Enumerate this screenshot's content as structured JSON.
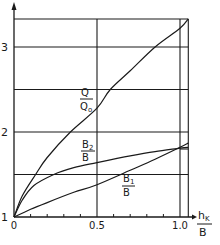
{
  "chart_data": {
    "type": "line",
    "title": "",
    "xlabel": {
      "numerator": "h_K",
      "numerator_main": "h",
      "numerator_sub": "K",
      "denominator": "B"
    },
    "ylabel": "",
    "xlim": [
      0,
      1.05
    ],
    "ylim": [
      1,
      3.33
    ],
    "x_ticks": [
      {
        "value": 0,
        "label": "0"
      },
      {
        "value": 0.5,
        "label": "0.5"
      },
      {
        "value": 1.0,
        "label": "1.0"
      }
    ],
    "x_minor_ticks": [
      0.1,
      0.2,
      0.3,
      0.4,
      0.6,
      0.7,
      0.8,
      0.9
    ],
    "y_ticks": [
      {
        "value": 1,
        "label": "1"
      },
      {
        "value": 2,
        "label": "2"
      },
      {
        "value": 3,
        "label": "3"
      }
    ],
    "h_gridlines": [
      1.5,
      2.0,
      2.5,
      3.0,
      3.33
    ],
    "v_gridlines": [
      0.5,
      1.0,
      1.05
    ],
    "reference_segment": {
      "y": 1.8,
      "x_from": 1.0,
      "x_to": 1.05
    },
    "grid": true,
    "legend": "inline-labels",
    "series": [
      {
        "name": "Q/Q0",
        "label_num": "Q",
        "label_den": "Q",
        "label_den_sub": "o",
        "x": [
          0,
          0.05,
          0.13,
          0.2,
          0.34,
          0.5,
          0.58,
          0.7,
          0.85,
          1.0,
          1.05
        ],
        "y": [
          1,
          1.25,
          1.5,
          1.7,
          2.0,
          2.28,
          2.5,
          2.72,
          3.0,
          3.22,
          3.33
        ]
      },
      {
        "name": "B2/B",
        "label_num": "B",
        "label_num_sub": "2",
        "label_den": "B",
        "x": [
          0,
          0.05,
          0.12,
          0.24,
          0.36,
          0.5,
          0.7,
          0.85,
          1.0,
          1.05
        ],
        "y": [
          1,
          1.2,
          1.37,
          1.5,
          1.58,
          1.64,
          1.72,
          1.77,
          1.81,
          1.82
        ]
      },
      {
        "name": "B1/B",
        "label_num": "B",
        "label_num_sub": "1",
        "label_den": "B",
        "x": [
          0,
          0.1,
          0.2,
          0.36,
          0.5,
          0.7,
          0.85,
          1.0,
          1.05
        ],
        "y": [
          1,
          1.09,
          1.17,
          1.29,
          1.38,
          1.55,
          1.68,
          1.82,
          1.87
        ]
      }
    ]
  }
}
